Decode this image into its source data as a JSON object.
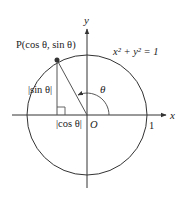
{
  "diagram": {
    "type": "unit-circle",
    "axes": {
      "x_label": "x",
      "y_label": "y",
      "origin_label": "O"
    },
    "circle": {
      "equation_label": "x² + y² = 1",
      "radius_label": "1"
    },
    "point": {
      "label": "P(cos θ, sin θ)"
    },
    "angle": {
      "label": "θ"
    },
    "segments": {
      "vertical_label": "|sin θ|",
      "horizontal_label": "|cos θ|"
    },
    "colors": {
      "stroke": "#333333",
      "point_fill": "#333333",
      "background": "#ffffff"
    }
  }
}
